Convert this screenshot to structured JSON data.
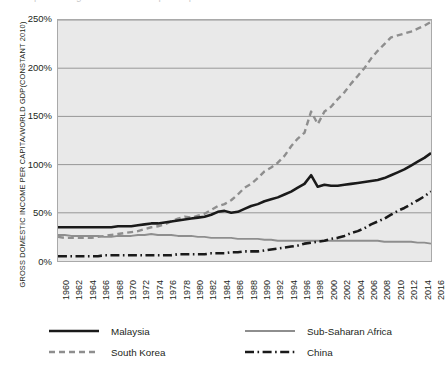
{
  "figure": {
    "top_clipped_text": "percentage of world GDP per capita",
    "background_color": "#ffffff",
    "plot_background_color": "#e9e9e9",
    "gridline_color": "#8c8c8c"
  },
  "axes": {
    "y_title": "GROSS DOMESTIC INCOME PER CAPITA/WORLD GDP(CONSTANT 2010)",
    "y_ticks": [
      "0%",
      "50%",
      "100%",
      "150%",
      "200%",
      "250%"
    ],
    "y_tick_values": [
      0,
      50,
      100,
      150,
      200,
      250
    ],
    "x_ticks": [
      "1960",
      "1962",
      "1964",
      "1966",
      "1968",
      "1970",
      "1972",
      "1974",
      "1976",
      "1978",
      "1980",
      "1982",
      "1984",
      "1986",
      "1988",
      "1990",
      "1992",
      "1994",
      "1996",
      "1998",
      "2000",
      "2002",
      "2004",
      "2006",
      "2008",
      "2010",
      "2012",
      "2014",
      "2016"
    ]
  },
  "legend": {
    "items": [
      {
        "label": "Malaysia",
        "style": "solid",
        "color": "#1a1a1a",
        "width": 2.6
      },
      {
        "label": "Sub-Saharan Africa",
        "style": "solid",
        "color": "#8e8e8e",
        "width": 1.9
      },
      {
        "label": "South Korea",
        "style": "dashed",
        "color": "#8e8e8e",
        "width": 2.4
      },
      {
        "label": "China",
        "style": "dashdot",
        "color": "#1a1a1a",
        "width": 2.6
      }
    ]
  },
  "chart_data": {
    "type": "line",
    "title": "",
    "xlabel": "",
    "ylabel": "GROSS DOMESTIC INCOME PER CAPITA/WORLD GDP(CONSTANT 2010)",
    "xlim": [
      1960,
      2016
    ],
    "ylim": [
      0,
      250
    ],
    "grid": true,
    "legend_position": "below",
    "units": "percent",
    "x": [
      1960,
      1961,
      1962,
      1963,
      1964,
      1965,
      1966,
      1967,
      1968,
      1969,
      1970,
      1971,
      1972,
      1973,
      1974,
      1975,
      1976,
      1977,
      1978,
      1979,
      1980,
      1981,
      1982,
      1983,
      1984,
      1985,
      1986,
      1987,
      1988,
      1989,
      1990,
      1991,
      1992,
      1993,
      1994,
      1995,
      1996,
      1997,
      1998,
      1999,
      2000,
      2001,
      2002,
      2003,
      2004,
      2005,
      2006,
      2007,
      2008,
      2009,
      2010,
      2011,
      2012,
      2013,
      2014,
      2015,
      2016
    ],
    "series": [
      {
        "name": "Malaysia",
        "style": "solid",
        "color": "#1a1a1a",
        "values": [
          35,
          35,
          35,
          35,
          35,
          35,
          35,
          35,
          35,
          36,
          36,
          36,
          37,
          38,
          39,
          39,
          40,
          41,
          42,
          43,
          44,
          45,
          46,
          48,
          51,
          52,
          50,
          51,
          54,
          57,
          59,
          62,
          64,
          66,
          69,
          72,
          76,
          80,
          89,
          77,
          79,
          78,
          78,
          79,
          80,
          81,
          82,
          83,
          84,
          86,
          89,
          92,
          95,
          99,
          103,
          107,
          112
        ]
      },
      {
        "name": "South Korea",
        "style": "dashed",
        "color": "#8e8e8e",
        "values": [
          25,
          24,
          24,
          24,
          24,
          24,
          25,
          26,
          27,
          28,
          29,
          30,
          31,
          33,
          35,
          36,
          38,
          41,
          44,
          46,
          45,
          47,
          49,
          53,
          57,
          59,
          63,
          69,
          76,
          80,
          86,
          93,
          97,
          102,
          109,
          119,
          127,
          133,
          155,
          142,
          155,
          160,
          168,
          175,
          184,
          192,
          200,
          210,
          218,
          225,
          232,
          234,
          236,
          238,
          241,
          244,
          248
        ]
      },
      {
        "name": "Sub-Saharan Africa",
        "style": "solid",
        "color": "#8e8e8e",
        "values": [
          27,
          27,
          26,
          26,
          26,
          26,
          26,
          25,
          25,
          26,
          26,
          26,
          27,
          27,
          28,
          27,
          27,
          27,
          26,
          26,
          26,
          25,
          25,
          24,
          24,
          24,
          24,
          23,
          23,
          23,
          23,
          22,
          22,
          21,
          21,
          21,
          21,
          21,
          21,
          21,
          21,
          21,
          21,
          21,
          21,
          21,
          21,
          21,
          21,
          20,
          20,
          20,
          20,
          20,
          19,
          19,
          18
        ]
      },
      {
        "name": "China",
        "style": "dashdot",
        "color": "#1a1a1a",
        "values": [
          5,
          5,
          5,
          5,
          5,
          5,
          5,
          6,
          6,
          6,
          6,
          6,
          6,
          6,
          6,
          6,
          6,
          6,
          7,
          7,
          7,
          7,
          7,
          8,
          8,
          8,
          9,
          9,
          10,
          10,
          10,
          11,
          12,
          13,
          14,
          15,
          16,
          18,
          19,
          20,
          21,
          23,
          24,
          26,
          29,
          31,
          34,
          38,
          41,
          44,
          48,
          52,
          55,
          59,
          63,
          67,
          72
        ]
      }
    ]
  }
}
